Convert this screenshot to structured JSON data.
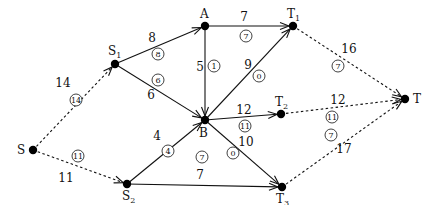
{
  "diagram": {
    "type": "network-flow",
    "nodes": [
      {
        "id": "S",
        "label": "S",
        "sub": "",
        "x": 33,
        "y": 150,
        "lx": 17,
        "ly": 154
      },
      {
        "id": "S1",
        "label": "S",
        "sub": "1",
        "x": 115,
        "y": 64,
        "lx": 108,
        "ly": 55
      },
      {
        "id": "S2",
        "label": "S",
        "sub": "2",
        "x": 127,
        "y": 184,
        "lx": 122,
        "ly": 200
      },
      {
        "id": "A",
        "label": "A",
        "sub": "",
        "x": 205,
        "y": 26,
        "lx": 200,
        "ly": 18
      },
      {
        "id": "B",
        "label": "B",
        "sub": "",
        "x": 205,
        "y": 120,
        "lx": 199,
        "ly": 137
      },
      {
        "id": "T1",
        "label": "T",
        "sub": "1",
        "x": 293,
        "y": 26,
        "lx": 287,
        "ly": 18
      },
      {
        "id": "T2",
        "label": "T",
        "sub": "2",
        "x": 281,
        "y": 114,
        "lx": 275,
        "ly": 106
      },
      {
        "id": "T3",
        "label": "T",
        "sub": "3",
        "x": 282,
        "y": 187,
        "lx": 276,
        "ly": 203
      },
      {
        "id": "T",
        "label": "T",
        "sub": "",
        "x": 405,
        "y": 99,
        "lx": 413,
        "ly": 103
      }
    ],
    "edges": [
      {
        "from": "S",
        "to": "S1",
        "capacity": "14",
        "flow": "14",
        "dashed": true,
        "cx": 63,
        "cy": 87,
        "fx": 76,
        "fy": 100
      },
      {
        "from": "S",
        "to": "S2",
        "capacity": "11",
        "flow": "11",
        "dashed": true,
        "cx": 66,
        "cy": 182,
        "fx": 78,
        "fy": 156
      },
      {
        "from": "S1",
        "to": "A",
        "capacity": "8",
        "flow": "8",
        "dashed": false,
        "cx": 152,
        "cy": 42,
        "fx": 158,
        "fy": 54
      },
      {
        "from": "S1",
        "to": "B",
        "capacity": "6",
        "flow": "6",
        "dashed": false,
        "cx": 151,
        "cy": 99,
        "fx": 158,
        "fy": 80
      },
      {
        "from": "A",
        "to": "T1",
        "capacity": "7",
        "flow": "7",
        "dashed": false,
        "cx": 244,
        "cy": 21,
        "fx": 246,
        "fy": 36
      },
      {
        "from": "A",
        "to": "B",
        "capacity": "5",
        "flow": "1",
        "dashed": false,
        "cx": 200,
        "cy": 71,
        "fx": 214,
        "fy": 66
      },
      {
        "from": "B",
        "to": "T1",
        "capacity": "9",
        "flow": "0",
        "dashed": false,
        "cx": 248,
        "cy": 69,
        "fx": 259,
        "fy": 76
      },
      {
        "from": "B",
        "to": "T2",
        "capacity": "12",
        "flow": "11",
        "dashed": false,
        "cx": 244,
        "cy": 114,
        "fx": 245,
        "fy": 126
      },
      {
        "from": "B",
        "to": "T3",
        "capacity": "10",
        "flow": "0",
        "dashed": false,
        "cx": 246,
        "cy": 146,
        "fx": 233,
        "fy": 153
      },
      {
        "from": "S2",
        "to": "B",
        "capacity": "4",
        "flow": "4",
        "dashed": false,
        "cx": 157,
        "cy": 140,
        "fx": 168,
        "fy": 151
      },
      {
        "from": "S2",
        "to": "T3",
        "capacity": "7",
        "flow": "7",
        "dashed": false,
        "cx": 200,
        "cy": 179,
        "fx": 202,
        "fy": 157
      },
      {
        "from": "T1",
        "to": "T",
        "capacity": "16",
        "flow": "7",
        "dashed": true,
        "cx": 349,
        "cy": 53,
        "fx": 338,
        "fy": 66
      },
      {
        "from": "T2",
        "to": "T",
        "capacity": "12",
        "flow": "11",
        "dashed": true,
        "cx": 338,
        "cy": 104,
        "fx": 332,
        "fy": 117
      },
      {
        "from": "T3",
        "to": "T",
        "capacity": "17",
        "flow": "7",
        "dashed": true,
        "cx": 344,
        "cy": 153,
        "fx": 331,
        "fy": 135
      }
    ]
  }
}
